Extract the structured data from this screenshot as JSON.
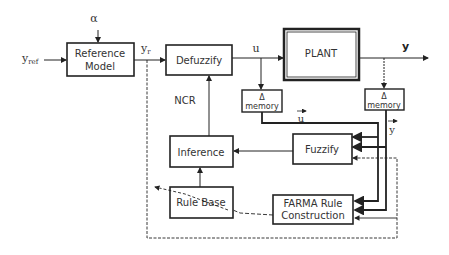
{
  "diagram": {
    "inputs": {
      "alpha": "α",
      "y_ref": "y",
      "y_ref_sub": "ref"
    },
    "blocks": {
      "reference_model": [
        "Reference",
        "Model"
      ],
      "defuzzify": "Defuzzify",
      "plant": "PLANT",
      "delta_memory_u": [
        "Δ",
        "memory"
      ],
      "delta_memory_y": [
        "Δ",
        "memory"
      ],
      "inference": "Inference",
      "fuzzify": "Fuzzify",
      "rule_base": "Rule Base",
      "farma": [
        "FARMA Rule",
        "Construction"
      ]
    },
    "signals": {
      "y_r": "y",
      "y_r_sub": "r",
      "u": "u",
      "y": "y",
      "ncr": "NCR",
      "u_vec": "u",
      "y_vec": "y"
    }
  }
}
